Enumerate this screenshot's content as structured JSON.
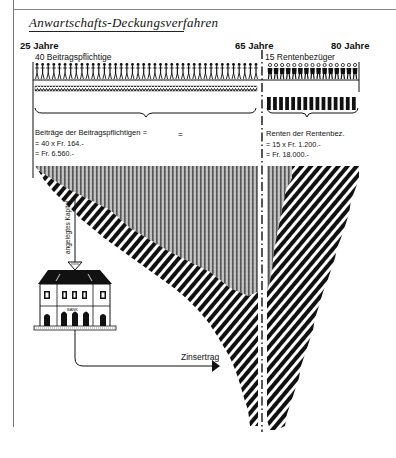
{
  "title": "Anwartschafts-Deckungsverfahren",
  "axis": {
    "start_label": "25 Jahre",
    "mid_label": "65 Jahre",
    "end_label": "80 Jahre"
  },
  "contributors": {
    "label": "40 Beitragspflichtige",
    "count": 40,
    "sum_lines": [
      "Beiträge der Beitragspflichtigen =",
      "= 40 x Fr. 164.-",
      "= Fr. 6.560.-"
    ]
  },
  "pensioners": {
    "label": "15 Rentenbezüger",
    "count": 15,
    "sum_lines": [
      "Renten der Rentenbez.",
      "= 15 x Fr. 1.200.-",
      "= Fr. 18.000.-"
    ]
  },
  "capital_arrow_label": "angelegtes Kapital",
  "bank_label": "BANK",
  "interest_label": "Zinsertrag",
  "colors": {
    "ink": "#111111",
    "paper": "#ffffff",
    "frame": "#777777"
  }
}
